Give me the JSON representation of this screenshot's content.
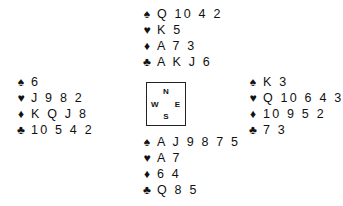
{
  "suits": {
    "spades": "♠",
    "hearts": "♥",
    "diamonds": "♦",
    "clubs": "♣"
  },
  "hands": {
    "north": {
      "spades": "Q 10 4 2",
      "hearts": "K 5",
      "diamonds": "A 7 3",
      "clubs": "A K J 6"
    },
    "west": {
      "spades": "6",
      "hearts": "J 9 8 2",
      "diamonds": "K Q J 8",
      "clubs": "10 5 4 2"
    },
    "east": {
      "spades": "K 3",
      "hearts": "Q 10 6 4 3",
      "diamonds": "10 9 5 2",
      "clubs": "7 3"
    },
    "south": {
      "spades": "A J 9 8 7 5",
      "hearts": "A 7",
      "diamonds": "6 4",
      "clubs": "Q 8 5"
    }
  },
  "compass": {
    "north": "N",
    "south": "S",
    "east": "E",
    "west": "W"
  }
}
